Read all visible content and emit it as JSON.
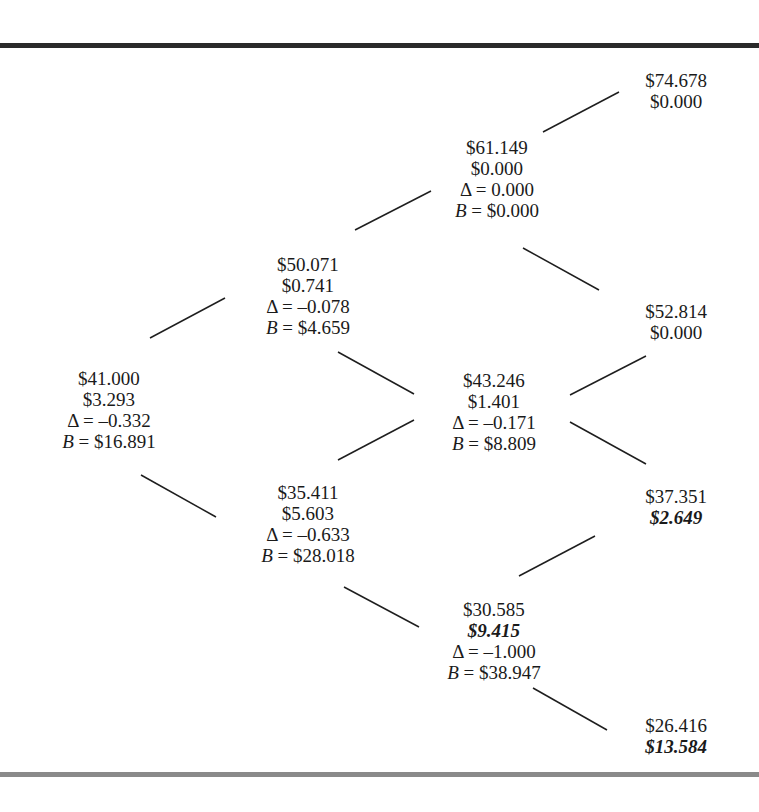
{
  "diagram": {
    "type": "binomial-tree",
    "nodes": [
      {
        "id": "n0",
        "x": 109,
        "y": 368,
        "stock": "$41.000",
        "option": "$3.293",
        "delta": "Δ = –0.332",
        "bond_label": "B",
        "bond": " = $16.891",
        "option_exercised": false
      },
      {
        "id": "n1u",
        "x": 308,
        "y": 254,
        "stock": "$50.071",
        "option": "$0.741",
        "delta": "Δ = –0.078",
        "bond_label": "B",
        "bond": " = $4.659",
        "option_exercised": false
      },
      {
        "id": "n1d",
        "x": 308,
        "y": 482,
        "stock": "$35.411",
        "option": "$5.603",
        "delta": "Δ = –0.633",
        "bond_label": "B",
        "bond": " = $28.018",
        "option_exercised": false
      },
      {
        "id": "n2uu",
        "x": 497,
        "y": 137,
        "stock": "$61.149",
        "option": "$0.000",
        "delta": "Δ = 0.000",
        "bond_label": "B",
        "bond": " = $0.000",
        "option_exercised": false
      },
      {
        "id": "n2ud",
        "x": 494,
        "y": 370,
        "stock": "$43.246",
        "option": "$1.401",
        "delta": "Δ = –0.171",
        "bond_label": "B",
        "bond": " = $8.809",
        "option_exercised": false
      },
      {
        "id": "n2dd",
        "x": 494,
        "y": 599,
        "stock": "$30.585",
        "option": "$9.415",
        "delta": "Δ = –1.000",
        "bond_label": "B",
        "bond": " = $38.947",
        "option_exercised": true
      },
      {
        "id": "n3uuu",
        "x": 676,
        "y": 70,
        "stock": "$74.678",
        "option": "$0.000",
        "option_exercised": false
      },
      {
        "id": "n3uud",
        "x": 676,
        "y": 301,
        "stock": "$52.814",
        "option": "$0.000",
        "option_exercised": false
      },
      {
        "id": "n3udd",
        "x": 676,
        "y": 486,
        "stock": "$37.351",
        "option": "$2.649",
        "option_exercised": true
      },
      {
        "id": "n3ddd",
        "x": 676,
        "y": 715,
        "stock": "$26.416",
        "option": "$13.584",
        "option_exercised": true
      }
    ],
    "edges": [
      {
        "from": "n0",
        "to": "n1u",
        "x1": 150,
        "y1": 338,
        "x2": 225,
        "y2": 298
      },
      {
        "from": "n0",
        "to": "n1d",
        "x1": 141,
        "y1": 475,
        "x2": 216,
        "y2": 517
      },
      {
        "from": "n1u",
        "to": "n2uu",
        "x1": 355,
        "y1": 230,
        "x2": 431,
        "y2": 191
      },
      {
        "from": "n1u",
        "to": "n2ud",
        "x1": 338,
        "y1": 352,
        "x2": 414,
        "y2": 394
      },
      {
        "from": "n1d",
        "to": "n2ud",
        "x1": 338,
        "y1": 460,
        "x2": 414,
        "y2": 420
      },
      {
        "from": "n1d",
        "to": "n2dd",
        "x1": 344,
        "y1": 587,
        "x2": 419,
        "y2": 627
      },
      {
        "from": "n2uu",
        "to": "n3uuu",
        "x1": 543,
        "y1": 132,
        "x2": 619,
        "y2": 92
      },
      {
        "from": "n2uu",
        "to": "n3uud",
        "x1": 523,
        "y1": 248,
        "x2": 599,
        "y2": 290
      },
      {
        "from": "n2ud",
        "to": "n3uud",
        "x1": 570,
        "y1": 395,
        "x2": 646,
        "y2": 356
      },
      {
        "from": "n2ud",
        "to": "n3udd",
        "x1": 570,
        "y1": 422,
        "x2": 646,
        "y2": 464
      },
      {
        "from": "n2dd",
        "to": "n3udd",
        "x1": 519,
        "y1": 576,
        "x2": 595,
        "y2": 536
      },
      {
        "from": "n2dd",
        "to": "n3ddd",
        "x1": 533,
        "y1": 688,
        "x2": 607,
        "y2": 730
      }
    ]
  },
  "colors": {
    "text": "#1a1a1a",
    "top_rule": "#2a2a2a",
    "bottom_rule": "#8a8a8a"
  }
}
